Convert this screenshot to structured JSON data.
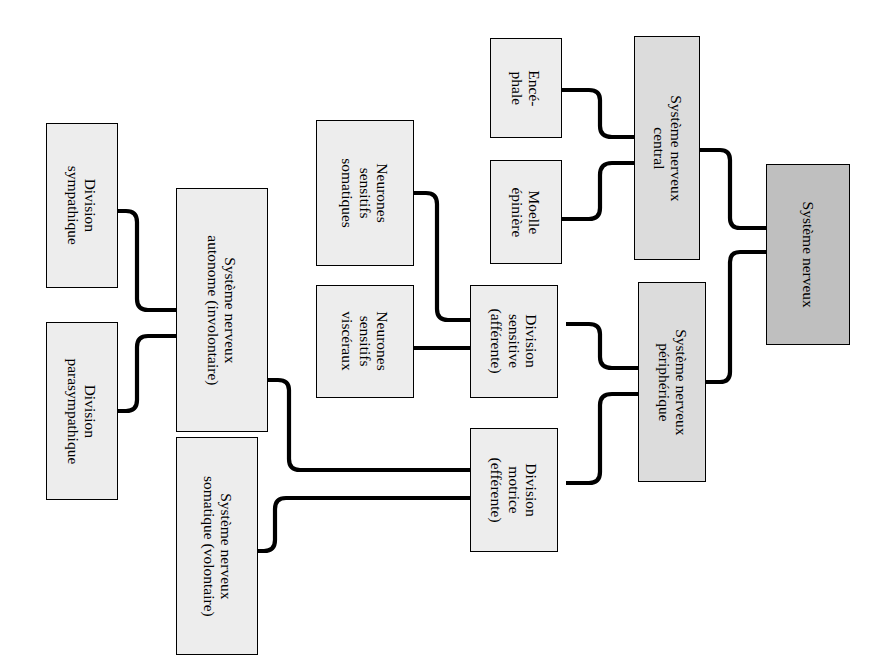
{
  "figure": {
    "label": "Figure 44.17",
    "orientation": "rotated-90-clockwise",
    "language": "fr"
  },
  "diagram": {
    "type": "hierarchy-flowchart",
    "colors": {
      "root_fill": "#bfbfbf",
      "level2_fill": "#dcdcdc",
      "leaf_fill": "#ededed",
      "border": "#000000",
      "connector": "#000000",
      "background": "#ffffff"
    },
    "nodes": [
      {
        "id": "systeme-nerveux",
        "label": "Système nerveux",
        "level": 0,
        "fill": "dark"
      },
      {
        "id": "snc",
        "label": "Système nerveux\ncentral",
        "level": 1,
        "fill": "mid"
      },
      {
        "id": "snp",
        "label": "Système nerveux\npériphérique",
        "level": 1,
        "fill": "mid"
      },
      {
        "id": "encephale",
        "label": "Encé-\nphale",
        "level": 2,
        "fill": "light"
      },
      {
        "id": "moelle-epiniere",
        "label": "Moelle\népinière",
        "level": 2,
        "fill": "light"
      },
      {
        "id": "division-sensitive",
        "label": "Division\nsensitive\n(afférente)",
        "level": 2,
        "fill": "light"
      },
      {
        "id": "division-motrice",
        "label": "Division\nmotrice\n(efférente)",
        "level": 2,
        "fill": "light"
      },
      {
        "id": "neurones-somatiques",
        "label": "Neurones\nsensitifs\nsomatiques",
        "level": 3,
        "fill": "light"
      },
      {
        "id": "neurones-visceraux",
        "label": "Neurones\nsensitifs\nviscéraux",
        "level": 3,
        "fill": "light"
      },
      {
        "id": "sn-autonome",
        "label": "Système nerveux\nautonome (involontaire)",
        "level": 3,
        "fill": "light"
      },
      {
        "id": "sn-somatique",
        "label": "Système nerveux\nsomatique (volontaire)",
        "level": 3,
        "fill": "light"
      },
      {
        "id": "division-sympathique",
        "label": "Division\nsympathique",
        "level": 4,
        "fill": "light"
      },
      {
        "id": "division-parasympathique",
        "label": "Division\nparasympathique",
        "level": 4,
        "fill": "light"
      }
    ],
    "edges": [
      {
        "from": "systeme-nerveux",
        "to": "snc"
      },
      {
        "from": "systeme-nerveux",
        "to": "snp"
      },
      {
        "from": "snc",
        "to": "encephale"
      },
      {
        "from": "snc",
        "to": "moelle-epiniere"
      },
      {
        "from": "snp",
        "to": "division-sensitive"
      },
      {
        "from": "snp",
        "to": "division-motrice"
      },
      {
        "from": "division-sensitive",
        "to": "neurones-somatiques"
      },
      {
        "from": "division-sensitive",
        "to": "neurones-visceraux"
      },
      {
        "from": "division-motrice",
        "to": "sn-autonome"
      },
      {
        "from": "division-motrice",
        "to": "sn-somatique"
      },
      {
        "from": "sn-autonome",
        "to": "division-sympathique"
      },
      {
        "from": "sn-autonome",
        "to": "division-parasympathique"
      }
    ]
  }
}
